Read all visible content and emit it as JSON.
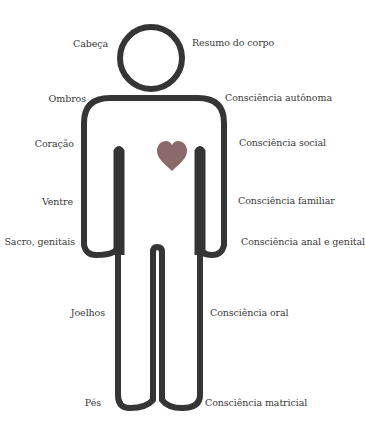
{
  "colors": {
    "outline": "#353535",
    "heart": "#8a6a6a",
    "text": "#3a3a3a",
    "background": "#ffffff"
  },
  "icons": {
    "heart": "heart-icon",
    "body": "human-figure-outline"
  },
  "labels": {
    "left": [
      {
        "key": "head",
        "text": "Cabeça"
      },
      {
        "key": "shoulders",
        "text": "Ombros"
      },
      {
        "key": "heart",
        "text": "Coração"
      },
      {
        "key": "belly",
        "text": "Ventre"
      },
      {
        "key": "sacrum",
        "text": "Sacro, genitais"
      },
      {
        "key": "knees",
        "text": "Joelhos"
      },
      {
        "key": "feet",
        "text": "Pés"
      }
    ],
    "right": [
      {
        "key": "body_summary",
        "text": "Resumo do corpo"
      },
      {
        "key": "autonomous",
        "text": "Consciência autônoma"
      },
      {
        "key": "social",
        "text": "Consciência social"
      },
      {
        "key": "familial",
        "text": "Consciência familiar"
      },
      {
        "key": "anal_genital",
        "text": "Consciência anal e genital"
      },
      {
        "key": "oral",
        "text": "Consciência oral"
      },
      {
        "key": "matrix",
        "text": "Consciência matricial"
      }
    ]
  }
}
